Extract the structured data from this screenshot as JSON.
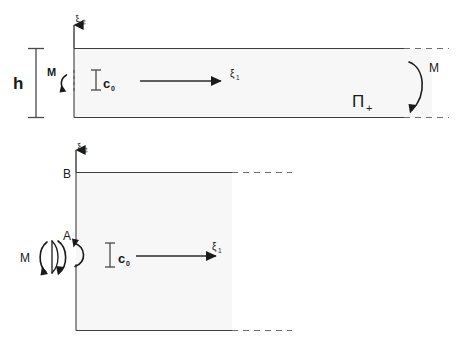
{
  "figure": {
    "background_color": "#ffffff",
    "line_color": "#3d3d3d",
    "fill_color": "#f7f7f7",
    "text_color": "#1a1a1a"
  },
  "top_panel": {
    "name": "semi-infinite-strip",
    "height_label": "h",
    "moment_left_label": "M",
    "moment_right_label": "M",
    "domain_label": "Π",
    "domain_sublabel": "+",
    "axis_horizontal_label": "ξ",
    "axis_horizontal_sublabel": "1",
    "axis_vertical_label": "ξ",
    "axis_vertical_sublabel": "2",
    "crack_label": "c",
    "crack_sublabel": "0"
  },
  "bottom_panel": {
    "name": "quarter-plane-region",
    "point_top_label": "B",
    "point_mid_label": "A",
    "moment_label": "M",
    "axis_horizontal_label": "ξ",
    "axis_horizontal_sublabel": "1",
    "axis_vertical_label": "ξ",
    "axis_vertical_sublabel": "2",
    "crack_label": "c",
    "crack_sublabel": "0"
  }
}
